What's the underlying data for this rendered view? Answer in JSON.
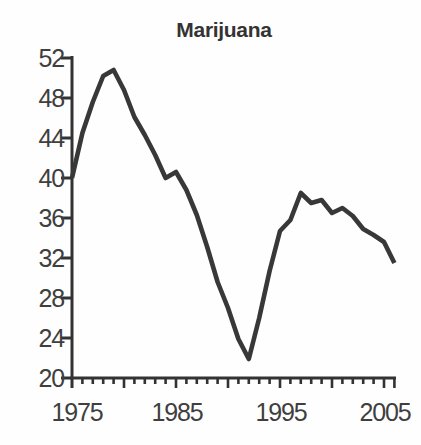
{
  "title": "Marijuana",
  "chart_data": {
    "type": "line",
    "title": "Marijuana",
    "xlabel": "",
    "ylabel": "",
    "x": [
      1975,
      1976,
      1977,
      1978,
      1979,
      1980,
      1981,
      1982,
      1983,
      1984,
      1985,
      1986,
      1987,
      1988,
      1989,
      1990,
      1991,
      1992,
      1993,
      1994,
      1995,
      1996,
      1997,
      1998,
      1999,
      2000,
      2001,
      2002,
      2003,
      2004,
      2005,
      2006
    ],
    "values": [
      40.0,
      44.5,
      47.6,
      50.2,
      50.8,
      48.8,
      46.1,
      44.3,
      42.3,
      40.0,
      40.6,
      38.8,
      36.3,
      33.1,
      29.6,
      27.0,
      23.9,
      21.9,
      26.0,
      30.7,
      34.7,
      35.8,
      38.5,
      37.5,
      37.8,
      36.5,
      37.0,
      36.2,
      34.9,
      34.3,
      33.6,
      31.5
    ],
    "xlim": [
      1975,
      2006
    ],
    "ylim": [
      20,
      52
    ],
    "yticks": [
      20,
      24,
      28,
      32,
      36,
      40,
      44,
      48,
      52
    ],
    "xtick_labels": [
      "1975",
      "1985",
      "1995",
      "2005"
    ],
    "xtick_label_years": [
      1975,
      1985,
      1995,
      2005
    ],
    "minor_xticks_every": 1,
    "major_xticks_every": 5,
    "grid": false,
    "legend": "none",
    "line_color": "#383838",
    "axis_color": "#333333",
    "text_color": "#3f3f3f",
    "background_color": "#fefefe"
  }
}
